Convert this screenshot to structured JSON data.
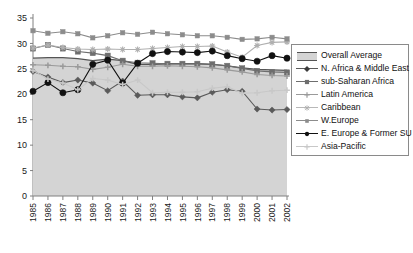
{
  "chart_data": {
    "type": "line",
    "title": "",
    "xlabel": "",
    "ylabel": "",
    "x": [
      1985,
      1986,
      1987,
      1988,
      1989,
      1990,
      1991,
      1992,
      1993,
      1994,
      1995,
      1996,
      1997,
      1998,
      1999,
      2000,
      2001,
      2002
    ],
    "xlim": [
      1985,
      2002
    ],
    "ylim": [
      0,
      35
    ],
    "yticks": [
      0,
      5,
      10,
      15,
      20,
      25,
      30,
      35
    ],
    "ytick_labels": [
      "0",
      "5",
      "10",
      "15",
      "20",
      "25",
      "30",
      "35"
    ],
    "xtick_labels": [
      "1985",
      "1986",
      "1987",
      "1988",
      "1989",
      "1990",
      "1991",
      "1992",
      "1993",
      "1994",
      "1995",
      "1996",
      "1997",
      "1998",
      "1999",
      "2000",
      "2001",
      "2002"
    ],
    "grid": false,
    "legend_position": "right",
    "series": [
      {
        "name": "Overall Average",
        "style": "area",
        "color": "#d4d4d4",
        "edge_color": "#555555",
        "marker": "none",
        "values": [
          27.1,
          27.2,
          27.2,
          27.0,
          26.6,
          26.9,
          26.6,
          25.9,
          25.9,
          26.0,
          26.0,
          26.0,
          25.9,
          25.6,
          25.2,
          24.9,
          24.8,
          24.7
        ]
      },
      {
        "name": "N. Africa & Middle East",
        "style": "line",
        "color": "#5a5a5a",
        "marker": "diamond",
        "values": [
          24.5,
          23.4,
          22.3,
          22.8,
          22.2,
          20.7,
          22.6,
          19.8,
          19.9,
          19.9,
          19.5,
          19.3,
          20.4,
          20.9,
          20.6,
          17.1,
          16.9,
          17.0
        ]
      },
      {
        "name": "sub-Saharan Africa",
        "style": "line",
        "color": "#6e6e6e",
        "marker": "square",
        "values": [
          29.0,
          29.7,
          29.0,
          28.4,
          28.1,
          27.6,
          26.6,
          26.2,
          26.1,
          26.0,
          26.0,
          26.0,
          25.9,
          25.6,
          25.1,
          24.6,
          24.4,
          24.3
        ]
      },
      {
        "name": "Latin America",
        "style": "line",
        "color": "#9a9a9a",
        "marker": "plus",
        "values": [
          25.8,
          25.7,
          25.5,
          25.4,
          24.9,
          25.3,
          25.9,
          25.5,
          25.5,
          25.6,
          25.5,
          25.4,
          25.2,
          24.8,
          24.4,
          23.9,
          23.7,
          23.6
        ]
      },
      {
        "name": "Caribbean",
        "style": "line",
        "color": "#b0b0b0",
        "marker": "star",
        "values": [
          29.1,
          29.7,
          29.2,
          28.9,
          28.8,
          28.9,
          28.8,
          28.8,
          29.0,
          29.2,
          29.4,
          29.4,
          29.5,
          28.3,
          27.3,
          29.6,
          30.2,
          30.3
        ]
      },
      {
        "name": "W.Europe",
        "style": "line",
        "color": "#8c8c8c",
        "marker": "square-sm",
        "values": [
          32.5,
          32.0,
          32.3,
          31.9,
          31.1,
          31.5,
          32.1,
          31.8,
          32.2,
          31.9,
          31.7,
          31.5,
          31.5,
          31.2,
          30.8,
          30.9,
          31.2,
          30.9
        ]
      },
      {
        "name": "E. Europe & Former SU",
        "style": "line",
        "color": "#111111",
        "marker": "circle",
        "values": [
          20.6,
          22.3,
          20.3,
          20.9,
          25.9,
          26.7,
          22.2,
          26.1,
          28.0,
          28.4,
          28.3,
          28.2,
          28.5,
          27.6,
          27.0,
          26.5,
          27.6,
          27.1
        ]
      },
      {
        "name": "Asia-Pacific",
        "style": "line",
        "color": "#c8c8c8",
        "marker": "plus",
        "values": [
          24.7,
          23.0,
          22.2,
          20.9,
          23.1,
          22.8,
          21.9,
          22.8,
          20.3,
          20.4,
          20.4,
          20.5,
          21.2,
          21.5,
          20.2,
          20.3,
          20.7,
          20.8
        ]
      }
    ]
  },
  "legend": {
    "items": [
      {
        "label": "Overall Average"
      },
      {
        "label": "N. Africa & Middle East"
      },
      {
        "label": "sub-Saharan Africa"
      },
      {
        "label": "Latin America"
      },
      {
        "label": "Caribbean"
      },
      {
        "label": "W.Europe"
      },
      {
        "label": "E. Europe & Former SU"
      },
      {
        "label": "Asia-Pacific"
      }
    ]
  }
}
